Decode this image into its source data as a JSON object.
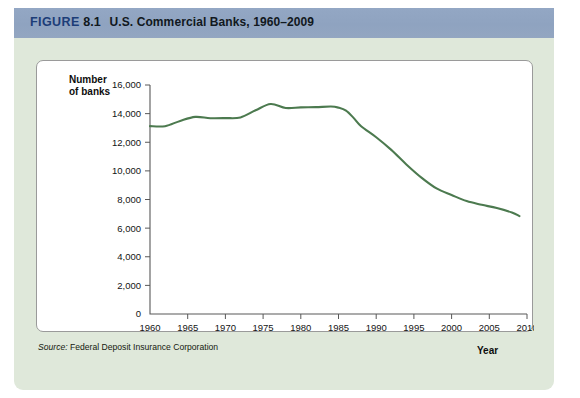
{
  "header": {
    "figure_word": "FIGURE",
    "figure_number": "8.1",
    "title": "U.S. Commercial Banks, 1960–2009",
    "bar_color": "#93a7c4",
    "text_color": "#1c3d78"
  },
  "panel": {
    "background_color": "#dfe8da",
    "card_background": "#ffffff"
  },
  "axis_titles": {
    "y_line1": "Number",
    "y_line2": "of banks",
    "x": "Year"
  },
  "source": {
    "label": "Source:",
    "text": "Federal Deposit Insurance Corporation"
  },
  "chart_data": {
    "type": "line",
    "title": "U.S. Commercial Banks, 1960–2009",
    "xlabel": "Year",
    "ylabel": "Number of banks",
    "xlim": [
      1960,
      2010
    ],
    "ylim": [
      0,
      16000
    ],
    "xticks": [
      1960,
      1965,
      1970,
      1975,
      1980,
      1985,
      1990,
      1995,
      2000,
      2005,
      2010
    ],
    "yticks": [
      0,
      2000,
      4000,
      6000,
      8000,
      10000,
      12000,
      14000,
      16000
    ],
    "ytick_labels": [
      "0",
      "2,000",
      "4,000",
      "6,000",
      "8,000",
      "10,000",
      "12,000",
      "14,000",
      "16,000"
    ],
    "xtick_labels": [
      "1960",
      "1965",
      "1970",
      "1975",
      "1980",
      "1985",
      "1990",
      "1995",
      "2000",
      "2005",
      "2010"
    ],
    "grid": false,
    "legend": false,
    "line_color": "#4c7a4f",
    "series": [
      {
        "name": "U.S. commercial banks",
        "x": [
          1960,
          1962,
          1964,
          1966,
          1968,
          1970,
          1972,
          1974,
          1976,
          1978,
          1980,
          1982,
          1984,
          1985,
          1986,
          1987,
          1988,
          1990,
          1992,
          1994,
          1996,
          1998,
          2000,
          2002,
          2004,
          2006,
          2008,
          2009
        ],
        "values": [
          13126,
          13124,
          13493,
          13770,
          13680,
          13688,
          13733,
          14230,
          14671,
          14391,
          14435,
          14451,
          14496,
          14417,
          14210,
          13703,
          13123,
          12347,
          11466,
          10452,
          9530,
          8774,
          8315,
          7888,
          7630,
          7402,
          7087,
          6840
        ]
      }
    ]
  }
}
